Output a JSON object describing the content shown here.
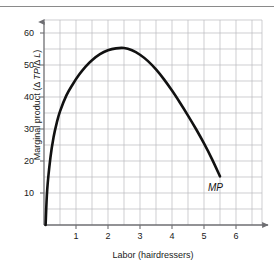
{
  "figure": {
    "width": 274,
    "height": 272,
    "background": "#ffffff",
    "top_rule_color": "#8a8a8a"
  },
  "chart_data": {
    "type": "line",
    "title": "",
    "subtitle": "",
    "xlabel": "Labor (hairdressers)",
    "ylabel_plain": "Marginal product (Δ TP/Δ L)",
    "ylabel_prefix": "Marginal product (Δ ",
    "ylabel_italic_1": "TP",
    "ylabel_middle": "/Δ ",
    "ylabel_italic_2": "L",
    "ylabel_suffix": ")",
    "xlim": [
      0,
      6.8
    ],
    "ylim": [
      0,
      64
    ],
    "xticks": [
      1,
      2,
      3,
      4,
      5,
      6
    ],
    "xtick_labels": [
      "1",
      "2",
      "3",
      "4",
      "5",
      "6"
    ],
    "yticks": [
      10,
      20,
      30,
      40,
      50,
      60
    ],
    "ytick_labels": [
      "10",
      "20",
      "30",
      "40",
      "50",
      "60"
    ],
    "grid": true,
    "grid_minor_step_x": 0.5,
    "grid_minor_step_y": 5,
    "grid_color": "#b9b9bd",
    "axis_color": "#6e6e72",
    "legend": "none",
    "annotations": [
      {
        "text": "MP",
        "x": 5.6,
        "y": 12,
        "style": "italic",
        "name": "mp-curve-label"
      }
    ],
    "series": [
      {
        "name": "MP",
        "label": "MP",
        "color": "#111111",
        "linewidth": 2.6,
        "x": [
          0.05,
          0.1,
          0.2,
          0.3,
          0.4,
          0.5,
          0.7,
          0.9,
          1.1,
          1.3,
          1.5,
          1.75,
          2.0,
          2.25,
          2.5,
          2.75,
          3.0,
          3.25,
          3.5,
          3.75,
          4.0,
          4.25,
          4.5,
          4.75,
          5.0,
          5.25,
          5.5
        ],
        "y": [
          0,
          11,
          21,
          27.5,
          32,
          35.5,
          40.5,
          44,
          47,
          49.5,
          51.5,
          53.4,
          54.6,
          55.2,
          55.3,
          54.6,
          53.2,
          51.2,
          48.6,
          45.5,
          42.0,
          38.2,
          34.2,
          30.0,
          25.5,
          20.6,
          15.2
        ]
      }
    ]
  },
  "geometry": {
    "plot_left": 44,
    "plot_right": 262,
    "plot_top": 20,
    "plot_bottom": 225,
    "px_per_x_unit": 32,
    "px_per_10_y": 32
  }
}
